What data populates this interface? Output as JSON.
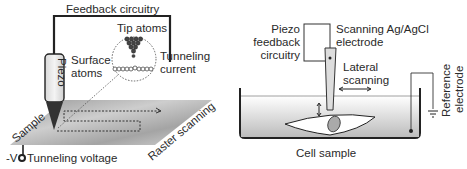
{
  "left_panel": {
    "title": "STM schematic",
    "feedback_label": "Feedback circuitry",
    "tip_atoms_label": "Tip atoms",
    "surface_label_1": "Surface",
    "surface_label_2": "atoms",
    "tunneling_current_1": "Tunneling",
    "tunneling_current_2": "current",
    "piezo_label": "Piezo",
    "sample_label": "Sample",
    "raster_label": "Raster scanning",
    "voltage_prefix": "-V",
    "voltage_label": "Tunneling voltage"
  },
  "right_panel": {
    "piezo_fb_1": "Piezo",
    "piezo_fb_2": "feedback",
    "piezo_fb_3": "circuitry",
    "scan_electrode_1": "Scanning Ag/AgCl",
    "scan_electrode_2": "electrode",
    "lateral_1": "Lateral",
    "lateral_2": "scanning",
    "reference_1": "Reference",
    "reference_2": "electrode",
    "cell_sample_label": "Cell sample"
  },
  "colors": {
    "line": "#222222",
    "piezo_fill": "#e6e6e6",
    "sample_fill": "#9a9a9a",
    "bath_top": "#ffffff",
    "bath_bottom": "#bdbdbd"
  }
}
